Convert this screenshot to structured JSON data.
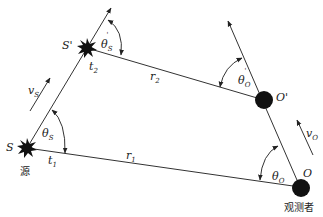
{
  "diagram": {
    "type": "relativistic doppler geometry",
    "nodes": {
      "source": {
        "label": "S",
        "caption": "源",
        "time": "t1"
      },
      "source_moved": {
        "label": "S'",
        "time": "t2"
      },
      "observer": {
        "label": "O",
        "caption": "观测者"
      },
      "observer_moved": {
        "label": "O'"
      }
    },
    "edges": {
      "r1": {
        "label": "r1",
        "from": "S",
        "to": "O"
      },
      "r2": {
        "label": "r2",
        "from": "S'",
        "to": "O'"
      }
    },
    "angles": {
      "theta_s": "θS",
      "theta_s_prime": "θ'S",
      "theta_o": "θO",
      "theta_o_prime": "θ'O"
    },
    "velocities": {
      "v_s": "vS",
      "v_o": "vO"
    }
  },
  "labels": {
    "S": "S",
    "S_prime": "S'",
    "O": "O",
    "O_prime": "O'",
    "source_caption": "源",
    "observer_caption": "观测者",
    "t1_main": "t",
    "t1_sub": "1",
    "t2_main": "t",
    "t2_sub": "2",
    "r1_main": "r",
    "r1_sub": "1",
    "r2_main": "r",
    "r2_sub": "2",
    "theta": "θ",
    "sub_S": "S",
    "sub_O": "O",
    "prime": "'",
    "v": "v"
  }
}
